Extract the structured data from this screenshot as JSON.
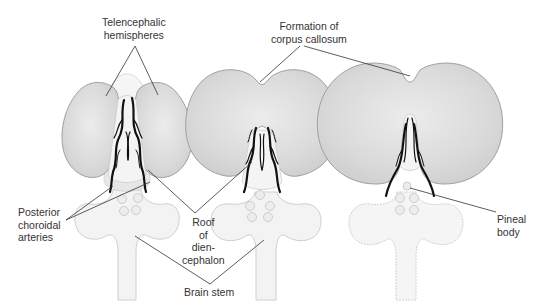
{
  "figure": {
    "type": "anatomical-diagram",
    "stages": 3,
    "colors": {
      "hemisphere_fill": "#dcdcdc",
      "hemisphere_stroke": "#9a9a9a",
      "brainstem_fill": "#f2f2f2",
      "brainstem_stroke": "#c8c8c8",
      "artery": "#111111",
      "leader_line": "#333333",
      "text": "#333333"
    }
  },
  "labels": {
    "telencephalic": "Telencephalic\nhemispheres",
    "corpus": "Formation of\ncorpus callosum",
    "posterior": "Posterior\nchoroidal\narteries",
    "roof": "Roof\nof\ndien-\ncephalon",
    "brainstem": "Brain stem",
    "pineal": "Pineal\nbody"
  }
}
